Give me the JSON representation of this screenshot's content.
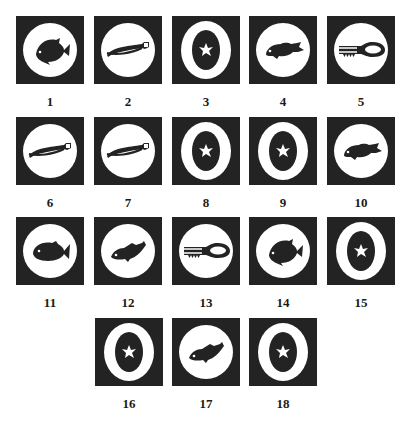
{
  "figure": {
    "colors": {
      "tile": "#232323",
      "disc": "#ffffff",
      "label": "#1a1a1a"
    },
    "items": [
      {
        "label": "1",
        "icon": "fish-angelfish"
      },
      {
        "label": "2",
        "icon": "pliers"
      },
      {
        "label": "3",
        "icon": "ring-star"
      },
      {
        "label": "4",
        "icon": "fish-grouper"
      },
      {
        "label": "5",
        "icon": "pliers-toothed"
      },
      {
        "label": "6",
        "icon": "pliers"
      },
      {
        "label": "7",
        "icon": "pliers"
      },
      {
        "label": "8",
        "icon": "ring-star"
      },
      {
        "label": "9",
        "icon": "ring-star"
      },
      {
        "label": "10",
        "icon": "fish-grouper"
      },
      {
        "label": "11",
        "icon": "fish-round"
      },
      {
        "label": "12",
        "icon": "fish-perch"
      },
      {
        "label": "13",
        "icon": "pliers-toothed"
      },
      {
        "label": "14",
        "icon": "fish-angelfish"
      },
      {
        "label": "15",
        "icon": "ring-star"
      },
      {
        "label": "16",
        "icon": "ring-star"
      },
      {
        "label": "17",
        "icon": "fish-perch"
      },
      {
        "label": "18",
        "icon": "ring-star"
      }
    ]
  }
}
